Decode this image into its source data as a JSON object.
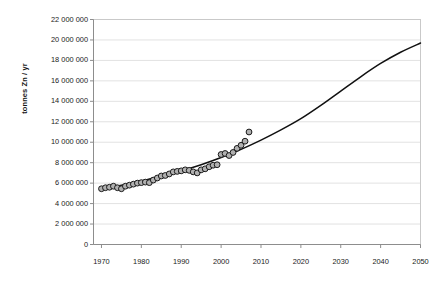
{
  "chart_data": {
    "type": "scatter",
    "title": "",
    "subtitle": "",
    "xlabel": "",
    "ylabel": "tonnes Zn / yr",
    "xlim": [
      1968,
      2050
    ],
    "ylim": [
      0,
      22000000
    ],
    "grid": true,
    "legend": "none",
    "xticks": [
      1970,
      1980,
      1990,
      2000,
      2010,
      2020,
      2030,
      2040,
      2050
    ],
    "xtick_labels": [
      "1970",
      "1980",
      "1990",
      "2000",
      "2010",
      "2020",
      "2030",
      "2040",
      "2050"
    ],
    "yticks": [
      0,
      2000000,
      4000000,
      6000000,
      8000000,
      10000000,
      12000000,
      14000000,
      16000000,
      18000000,
      20000000,
      22000000
    ],
    "ytick_labels": [
      "0",
      "2 000 000",
      "4 000 000",
      "6 000 000",
      "8 000 000",
      "10 000 000",
      "12 000 000",
      "14 000 000",
      "16 000 000",
      "18 000 000",
      "20 000 000",
      "22 000 000"
    ],
    "series": [
      {
        "name": "Annual zinc production (observed)",
        "type": "scatter",
        "marker": "circle",
        "marker_fill": "#b0b0b0",
        "marker_edge": "#1a1a1a",
        "x": [
          1970,
          1971,
          1972,
          1973,
          1974,
          1975,
          1976,
          1977,
          1978,
          1979,
          1980,
          1981,
          1982,
          1983,
          1984,
          1985,
          1986,
          1987,
          1988,
          1989,
          1990,
          1991,
          1992,
          1993,
          1994,
          1995,
          1996,
          1997,
          1998,
          1999,
          2000,
          2001,
          2002,
          2003,
          2004,
          2005,
          2006,
          2007
        ],
        "y": [
          5450000,
          5550000,
          5600000,
          5700000,
          5550000,
          5450000,
          5700000,
          5800000,
          5900000,
          6000000,
          6050000,
          6100000,
          6050000,
          6300000,
          6500000,
          6700000,
          6750000,
          6900000,
          7100000,
          7150000,
          7200000,
          7300000,
          7250000,
          7100000,
          7000000,
          7300000,
          7400000,
          7600000,
          7750000,
          7800000,
          8800000,
          8900000,
          8700000,
          9000000,
          9400000,
          9700000,
          10100000,
          11000000
        ]
      },
      {
        "name": "Projected trend (fitted growth curve)",
        "type": "line",
        "line_color": "#111111",
        "x": [
          1970,
          1975,
          1980,
          1985,
          1990,
          1995,
          2000,
          2005,
          2010,
          2015,
          2020,
          2025,
          2030,
          2035,
          2040,
          2045,
          2050
        ],
        "y": [
          5400000,
          5800000,
          6200000,
          6700000,
          7200000,
          7800000,
          8500000,
          9300000,
          10200000,
          11200000,
          12300000,
          13600000,
          15000000,
          16400000,
          17700000,
          18800000,
          19700000
        ]
      }
    ]
  },
  "colors": {
    "marker_fill": "#b0b0b0",
    "marker_edge": "#1a1a1a",
    "curve": "#111111",
    "grid": "#e2e2e2",
    "frame": "#c9c9c9",
    "text": "#1a1a1a",
    "background": "#ffffff"
  }
}
